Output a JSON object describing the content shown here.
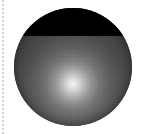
{
  "canvas": {
    "width": 143,
    "height": 134,
    "background_color": "#ffffff"
  },
  "guide": {
    "name": "dotted-margin-line",
    "orientation": "vertical",
    "x": 3,
    "color": "#c9ced8",
    "style": "dotted"
  },
  "figure": {
    "type": "shaded-sphere",
    "title": "",
    "disc": {
      "center_x": 73,
      "center_y": 67,
      "radius": 59,
      "edge_color": "#3a3a3a"
    },
    "glow": {
      "highlight_x": 73,
      "highlight_y": 84,
      "highlight_color": "#f2f2f2",
      "falloff_color": "#373737"
    },
    "terminator": {
      "y": 36,
      "shadow_color": "#000000",
      "label": ""
    }
  }
}
